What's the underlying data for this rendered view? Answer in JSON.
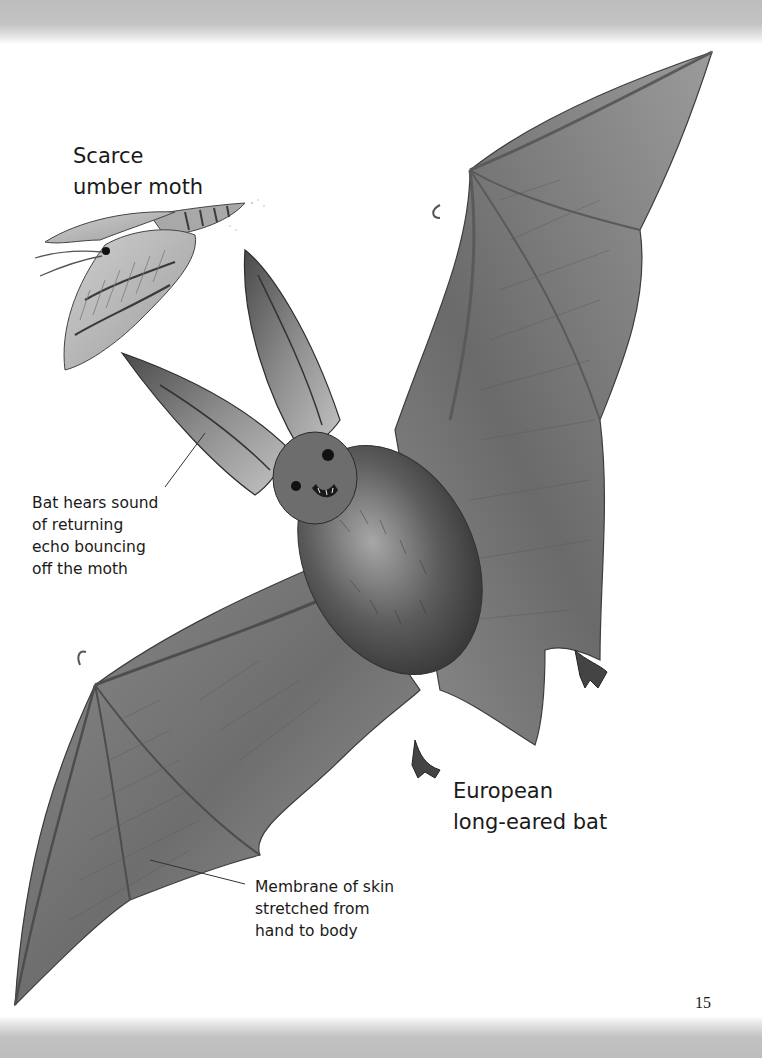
{
  "page": {
    "number": "15",
    "background": "#ffffff",
    "scan_edge_color": "#bdbdbd"
  },
  "labels": {
    "moth": {
      "lines": [
        "Scarce",
        "umber moth"
      ]
    },
    "echo": {
      "lines": [
        "Bat hears sound",
        "of returning",
        "echo bouncing",
        "off the moth"
      ]
    },
    "bat": {
      "lines": [
        "European",
        "long-eared bat"
      ]
    },
    "membrane": {
      "lines": [
        "Membrane of skin",
        "stretched from",
        "hand to body"
      ]
    }
  },
  "illustrations": {
    "moth": "scarce-umber-moth-illustration",
    "bat": "european-long-eared-bat-illustration"
  }
}
